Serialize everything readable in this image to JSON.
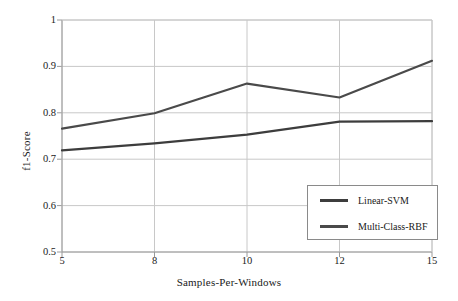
{
  "chart_data": {
    "type": "line",
    "title": "",
    "xlabel": "Samples-Per-Windows",
    "ylabel": "f1-Score",
    "categories": [
      "5",
      "8",
      "10",
      "12",
      "15"
    ],
    "x": [
      5,
      8,
      10,
      12,
      15
    ],
    "ylim": [
      0.5,
      1
    ],
    "yticks": [
      "0.5",
      "0.6",
      "0.7",
      "0.8",
      "0.9",
      "1"
    ],
    "ytick_values": [
      0.5,
      0.6,
      0.7,
      0.8,
      0.9,
      1.0
    ],
    "grid": true,
    "legend_position": "lower-right",
    "series": [
      {
        "name": "Linear-SVM",
        "color": "#3d3d3d",
        "values": [
          0.719,
          0.734,
          0.753,
          0.781,
          0.782
        ]
      },
      {
        "name": "Multi-Class-RBF",
        "color": "#4a4a4a",
        "values": [
          0.766,
          0.799,
          0.863,
          0.833,
          0.912
        ]
      }
    ]
  },
  "axes": {
    "grid_color": "#c8c8c8",
    "axis_color": "#9a9a9a"
  },
  "legend": {
    "entries": [
      {
        "label": "Linear-SVM"
      },
      {
        "label": "Multi-Class-RBF"
      }
    ]
  }
}
